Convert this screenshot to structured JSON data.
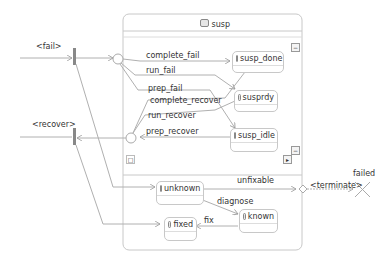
{
  "composite": {
    "title": "susp"
  },
  "triggers": {
    "fail": "<fail>",
    "recover": "<recover>",
    "terminate": "<terminate>"
  },
  "states": {
    "susp_done": "susp_done",
    "susprdy": "susprdy",
    "susp_idle": "susp_idle",
    "unknown": "unknown",
    "known": "known",
    "fixed": "fixed"
  },
  "transitions": {
    "complete_fail": "complete_fail",
    "run_fail": "run_fail",
    "prep_fail": "prep_fail",
    "complete_recover": "complete_recover",
    "run_recover": "run_recover",
    "prep_recover": "prep_recover",
    "unfixable": "unfixable",
    "diagnose": "diagnose",
    "fix": "fix"
  },
  "final": {
    "label": "failed"
  },
  "controls": {
    "collapse_top": "−",
    "collapse_mid": "−",
    "expand": "▸",
    "region_mark": "□"
  },
  "colors": {
    "line": "#b0b0b0",
    "bar": "#888888",
    "border": "#c8c8c8"
  }
}
